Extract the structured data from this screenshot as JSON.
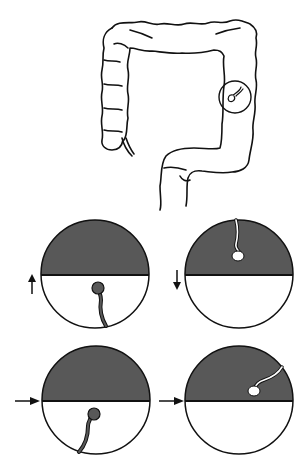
{
  "figure": {
    "colors": {
      "fluid": "#585858",
      "line": "#111111",
      "background": "#ffffff"
    },
    "colon": {
      "highlight_circle": {
        "cx": 235,
        "cy": 97,
        "r": 16
      }
    },
    "panels": [
      {
        "id": "panel-1",
        "arrow": "up",
        "polyp": "below-fluid-line, dark, stalk from bottom"
      },
      {
        "id": "panel-2",
        "arrow": "down",
        "polyp": "in fluid, white, stalk from top"
      },
      {
        "id": "panel-3",
        "arrow": "right",
        "polyp": "below-fluid-line, dark, stalk from bottom"
      },
      {
        "id": "panel-4",
        "arrow": "right",
        "polyp": "in fluid, white, stalk from upper right"
      }
    ]
  }
}
